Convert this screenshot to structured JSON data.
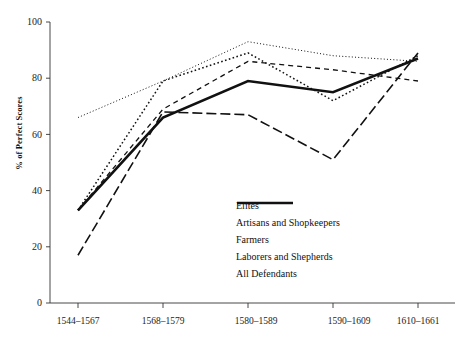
{
  "figure": {
    "cut_caption": "",
    "background": "#ffffff",
    "ink": "#111111"
  },
  "axes": {
    "y_label": "% of Perfect Scores",
    "y_ticks": [
      "100",
      "80",
      "60",
      "40",
      "20",
      "0"
    ],
    "x_ticks": [
      "1544–1567",
      "1568–1579",
      "1580–1589",
      "1590–1609",
      "1610–1661"
    ]
  },
  "legend": {
    "items": [
      {
        "label": "Elites",
        "style": "fine-dotted",
        "color": "#111111"
      },
      {
        "label": "Artisans and Shopkeepers",
        "style": "dotted",
        "color": "#111111"
      },
      {
        "label": "Farmers",
        "style": "dashed",
        "color": "#111111"
      },
      {
        "label": "Laborers and Shepherds",
        "style": "long-dashed",
        "color": "#111111"
      },
      {
        "label": "All Defendants",
        "style": "solid-thick",
        "color": "#111111"
      }
    ]
  },
  "chart_data": {
    "type": "line",
    "title": "",
    "subtitle": "",
    "xlabel": "",
    "ylabel": "% of Perfect Scores",
    "categories": [
      "1544–1567",
      "1568–1579",
      "1580–1589",
      "1590–1609",
      "1610–1661"
    ],
    "ylim": [
      0,
      100
    ],
    "yticks": [
      0,
      20,
      40,
      60,
      80,
      100
    ],
    "grid": false,
    "legend_position": "inside-lower-right",
    "series": [
      {
        "name": "Elites",
        "style": "fine-dotted",
        "color": "#111111",
        "values": [
          66,
          79,
          93,
          88,
          86
        ]
      },
      {
        "name": "Artisans and Shopkeepers",
        "style": "dotted",
        "color": "#111111",
        "values": [
          33,
          79,
          89,
          72,
          88
        ]
      },
      {
        "name": "Farmers",
        "style": "dashed",
        "color": "#111111",
        "values": [
          33,
          69,
          86,
          83,
          79
        ]
      },
      {
        "name": "Laborers and Shepherds",
        "style": "long-dashed",
        "color": "#111111",
        "values": [
          17,
          68,
          67,
          51,
          89
        ]
      },
      {
        "name": "All Defendants",
        "style": "solid-thick",
        "color": "#111111",
        "values": [
          33,
          66,
          79,
          75,
          87
        ]
      }
    ]
  }
}
